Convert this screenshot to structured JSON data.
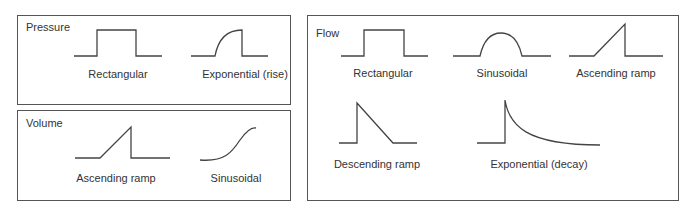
{
  "panels": {
    "pressure": {
      "title": "Pressure",
      "waveforms": [
        {
          "label": "Rectangular",
          "shape": "rectangular"
        },
        {
          "label": "Exponential (rise)",
          "shape": "exponential-rise"
        }
      ]
    },
    "volume": {
      "title": "Volume",
      "waveforms": [
        {
          "label": "Ascending ramp",
          "shape": "ascending-ramp"
        },
        {
          "label": "Sinusoidal",
          "shape": "sinusoidal-s-curve"
        }
      ]
    },
    "flow": {
      "title": "Flow",
      "waveforms": [
        {
          "label": "Rectangular",
          "shape": "rectangular"
        },
        {
          "label": "Sinusoidal",
          "shape": "sinusoidal-half-wave"
        },
        {
          "label": "Ascending ramp",
          "shape": "ascending-ramp"
        },
        {
          "label": "Descending ramp",
          "shape": "descending-ramp"
        },
        {
          "label": "Exponential (decay)",
          "shape": "exponential-decay"
        }
      ]
    }
  },
  "colors": {
    "stroke": "#444444",
    "border": "#555555",
    "text": "#333333",
    "background": "#ffffff"
  }
}
